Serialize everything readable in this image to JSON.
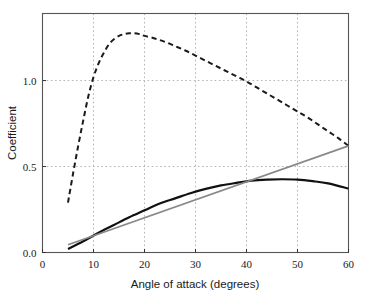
{
  "chart_data": {
    "type": "line",
    "title": "",
    "xlabel": "Angle of attack (degrees)",
    "ylabel": "Coefficient",
    "xlim": [
      0,
      60
    ],
    "ylim": [
      0.0,
      1.39
    ],
    "xticks": [
      0,
      10,
      20,
      30,
      40,
      50,
      60
    ],
    "xticklabels": [
      "0",
      "10",
      "20",
      "30",
      "40",
      "50",
      "60"
    ],
    "yticks": [
      0.0,
      0.5,
      1.0
    ],
    "yticklabels": [
      "0.0",
      "0.5",
      "1.0"
    ],
    "grid": true,
    "grid_style": "dotted",
    "grid_color": "#b4b4b4",
    "legend": "none",
    "series": [
      {
        "name": "dashed-curve",
        "style": "dashed",
        "color": "#1a1a1a",
        "width": 2.0,
        "x": [
          5,
          6,
          7,
          8,
          9,
          10,
          11,
          12,
          13,
          14,
          15,
          16,
          17,
          18,
          19,
          20,
          22,
          24,
          26,
          28,
          30,
          32,
          34,
          36,
          38,
          40,
          42,
          44,
          46,
          48,
          50,
          52,
          54,
          56,
          58,
          60
        ],
        "y": [
          0.29,
          0.46,
          0.62,
          0.77,
          0.91,
          1.02,
          1.1,
          1.16,
          1.21,
          1.24,
          1.26,
          1.27,
          1.275,
          1.275,
          1.27,
          1.26,
          1.245,
          1.225,
          1.2,
          1.175,
          1.145,
          1.115,
          1.085,
          1.055,
          1.025,
          0.995,
          0.96,
          0.925,
          0.89,
          0.855,
          0.82,
          0.785,
          0.745,
          0.705,
          0.665,
          0.62
        ]
      },
      {
        "name": "solid-black-curve",
        "style": "solid",
        "color": "#111111",
        "width": 2.2,
        "x": [
          5,
          8,
          11,
          14,
          17,
          20,
          23,
          26,
          29,
          32,
          35,
          38,
          41,
          44,
          47,
          50,
          53,
          56,
          60
        ],
        "y": [
          0.02,
          0.065,
          0.115,
          0.16,
          0.205,
          0.245,
          0.285,
          0.315,
          0.345,
          0.37,
          0.39,
          0.405,
          0.418,
          0.424,
          0.426,
          0.424,
          0.415,
          0.402,
          0.372
        ]
      },
      {
        "name": "solid-gray-line",
        "style": "solid",
        "color": "#898989",
        "width": 1.7,
        "x": [
          5,
          60
        ],
        "y": [
          0.045,
          0.62
        ]
      }
    ],
    "annotations": {
      "dashed_peak": {
        "x": 19,
        "y": 1.275
      },
      "solid_black_peak": {
        "x": 47,
        "y": 0.426
      },
      "crossing_gray_black": {
        "x": 41,
        "y": 0.42
      },
      "dashed_start": {
        "x": 5,
        "y": 0.29
      },
      "endpoint_x": 60,
      "dashed_end_y": 0.62,
      "gray_end_y": 0.62,
      "black_end_y": 0.372
    }
  },
  "axes": {
    "frame_color": "#555555",
    "tick_color": "#333333"
  }
}
